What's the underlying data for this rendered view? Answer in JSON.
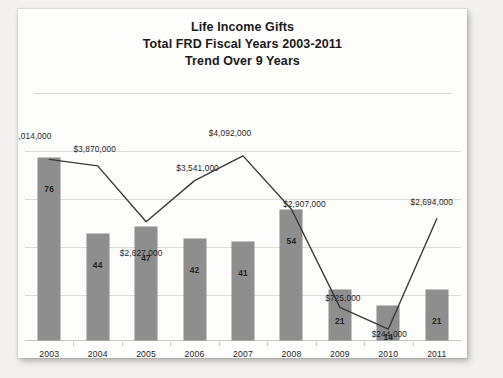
{
  "card": {
    "title_lines": [
      "Life Income Gifts",
      "Total FRD Fiscal Years 2003-2011",
      "Trend Over 9 Years"
    ]
  },
  "chart_data": {
    "type": "bar",
    "title": "Life Income Gifts Total FRD Fiscal Years 2003-2011 Trend Over 9 Years",
    "xlabel": "",
    "ylabel": "",
    "grid": true,
    "legend": "none",
    "categories": [
      "2003",
      "2004",
      "2005",
      "2006",
      "2007",
      "2008",
      "2009",
      "2010",
      "2011"
    ],
    "series": [
      {
        "name": "Number of Gifts",
        "type": "bar",
        "values": [
          76,
          44,
          47,
          42,
          41,
          54,
          21,
          14,
          21
        ],
        "labels": [
          "76",
          "44",
          "47",
          "42",
          "41",
          "54",
          "21",
          "14",
          "21"
        ],
        "color": "#8e8e8e"
      },
      {
        "name": "Dollar Value",
        "type": "line",
        "values": [
          4014000,
          3870000,
          2627000,
          3541000,
          4092000,
          2907000,
          725000,
          244000,
          2694000
        ],
        "labels": [
          "$4,014,000",
          "$3,870,000",
          "$2,627,000",
          "$3,541,000",
          "$4,092,000",
          "$2,907,000",
          "$725,000",
          "$244,000",
          "$2,694,000"
        ],
        "color": "#3a3a3a"
      }
    ],
    "bar_ylim": [
      0,
      80
    ],
    "line_ylim": [
      0,
      4400000
    ]
  }
}
